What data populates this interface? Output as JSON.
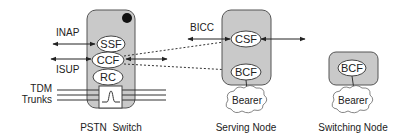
{
  "colors": {
    "node_fill": "#c9c9c9",
    "node_stroke": "#555555",
    "ellipse_fill": "#ffffff",
    "line": "#222222"
  },
  "pstn_switch": {
    "label": "PSTN  Switch",
    "functions": {
      "ssf": "SSF",
      "ccf": "CCF",
      "rc": "RC"
    },
    "interfaces": {
      "inap": "INAP",
      "isup": "ISUP"
    },
    "trunks_label_line1": "TDM",
    "trunks_label_line2": "Trunks"
  },
  "serving_node": {
    "label": "Serving Node",
    "functions": {
      "csf": "CSF",
      "bcf": "BCF"
    },
    "interface": "BICC",
    "bearer": "Bearer"
  },
  "switching_node": {
    "label": "Switching Node",
    "functions": {
      "bcf": "BCF"
    },
    "bearer": "Bearer"
  }
}
